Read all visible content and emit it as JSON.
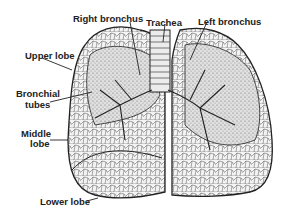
{
  "diagram": {
    "labels": {
      "right_bronchus": "Right bronchus",
      "trachea": "Trachea",
      "left_bronchus": "Left bronchus",
      "upper_lobe": "Upper lobe",
      "bronchial_tubes_1": "Bronchial",
      "bronchial_tubes_2": "tubes",
      "middle_lobe_1": "Middle",
      "middle_lobe_2": "lobe",
      "lower_lobe": "Lower lobe"
    },
    "colors": {
      "ink": "#222222",
      "fill": "#e8e8e8",
      "background": "#ffffff"
    }
  }
}
